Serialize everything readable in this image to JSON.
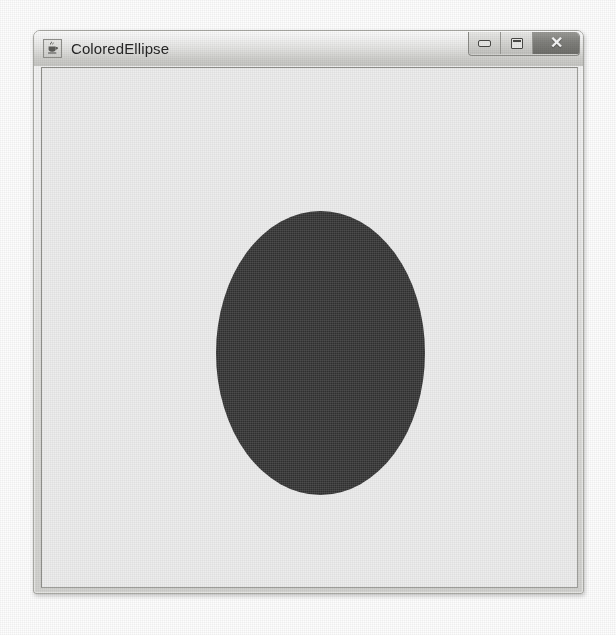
{
  "window": {
    "title": "ColoredEllipse",
    "app_icon": "java-coffee-cup-icon",
    "controls": {
      "minimize_label": "",
      "minimize_icon": "minimize-icon",
      "maximize_label": "",
      "maximize_icon": "maximize-icon",
      "close_label": "✕",
      "close_icon": "close-icon"
    },
    "frame_color": "#d2d2cf",
    "titlebar_color": "#e2e2e0",
    "border_color": "#a9a9a4"
  },
  "canvas": {
    "background_color": "#ededed",
    "shape": {
      "name": "ellipse",
      "fill_color": "#3a3a3a",
      "x": 174,
      "y": 143,
      "width": 209,
      "height": 284
    }
  }
}
